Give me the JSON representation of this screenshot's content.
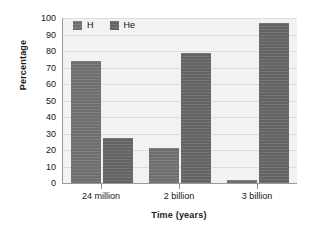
{
  "chart_data": {
    "type": "bar",
    "title": "",
    "categories": [
      "24 million",
      "2 billion",
      "3 billion"
    ],
    "series": [
      {
        "name": "H",
        "values": [
          74,
          21,
          2
        ]
      },
      {
        "name": "He",
        "values": [
          27,
          79,
          97
        ]
      }
    ],
    "xlabel": "Time (years)",
    "ylabel": "Percentage",
    "ylim": [
      0,
      100
    ],
    "ytick_labels": [
      "0",
      "10",
      "20",
      "30",
      "40",
      "50",
      "60",
      "70",
      "80",
      "90",
      "100"
    ],
    "ytick_values": [
      0,
      10,
      20,
      30,
      40,
      50,
      60,
      70,
      80,
      90,
      100
    ],
    "grid": "horizontal",
    "legend_position": "top-left",
    "legend": [
      "H",
      "He"
    ],
    "colors": {
      "series_h": "#6e6e6e",
      "series_he": "#646464",
      "plot_background": "#f2f2f0",
      "gridline": "#dcdcda",
      "axis": "#9a9a9a",
      "text": "#141414",
      "page_background": "#ffffff"
    }
  }
}
